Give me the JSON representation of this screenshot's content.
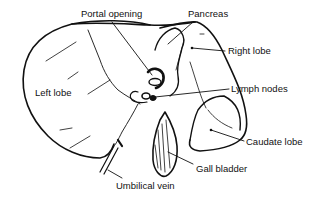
{
  "diagram": {
    "stroke_color": "#111111",
    "background": "#ffffff",
    "labels": [
      {
        "id": "portal-opening",
        "text": "Portal opening",
        "x": 81,
        "y": 9
      },
      {
        "id": "pancreas",
        "text": "Pancreas",
        "x": 188,
        "y": 9
      },
      {
        "id": "right-lobe",
        "text": "Right lobe",
        "x": 228,
        "y": 46
      },
      {
        "id": "left-lobe",
        "text": "Left lobe",
        "x": 35,
        "y": 88
      },
      {
        "id": "lymph-nodes",
        "text": "Lymph nodes",
        "x": 231,
        "y": 84
      },
      {
        "id": "caudate-lobe",
        "text": "Caudate lobe",
        "x": 246,
        "y": 137
      },
      {
        "id": "gall-bladder",
        "text": "Gall bladder",
        "x": 196,
        "y": 164
      },
      {
        "id": "umbilical-vein",
        "text": "Umbilical vein",
        "x": 116,
        "y": 181
      }
    ]
  }
}
